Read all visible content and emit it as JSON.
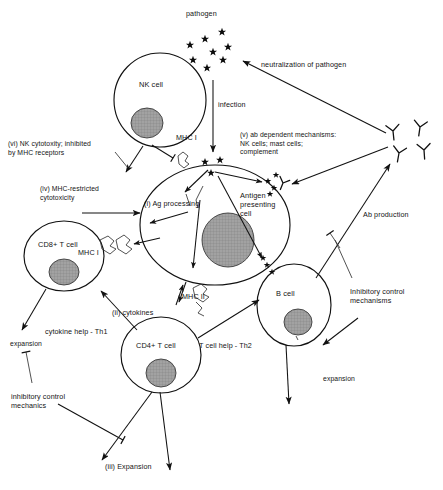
{
  "figure": {
    "background": "#ffffff",
    "ink": "#111111",
    "nucleus_fill": "#9a9a9a"
  },
  "labels": {
    "pathogen": "pathogen",
    "infection": "infection",
    "neutralization": "neutralization of pathogen",
    "nk_cell": "NK cell",
    "mhc_i_top": "MHC I",
    "mhc_i_left": "MHC I",
    "mhc_ii": "MHC II",
    "note_vi": "(vi) NK cytotoxity; inhibited\nby MHC receptors",
    "note_iv": "(iv) MHC-restricted\ncytotoxicity",
    "note_v": "(v) ab dependent mechanisms:\nNK cells; mast cells;\ncomplement",
    "step_i": "(i) Ag processing",
    "step_ii": "(ii) cytokines",
    "step_iii": "(iii) Expansion",
    "apc": "Antigen\npresenting\ncell",
    "cd8": "CD8+ T cell",
    "cd4": "CD4+ T cell",
    "b_cell": "B cell",
    "cytokine_help": "cytokine help - Th1",
    "t_cell_help": "T cell help - Th2",
    "ab_production": "Ab production",
    "expansion_left": "expansion",
    "expansion_right": "expansion",
    "inhibitory_left": "inhibitory control\nmechanics",
    "inhibitory_right": "Inhibitory control\nmechanisms"
  },
  "icons": {
    "pathogen": "star-glyph",
    "antibody": "y-shape-antibody-icon",
    "receptor": "mhc-receptor-icon",
    "inhibition": "inhibition-bar-icon",
    "arrow": "arrowhead-icon"
  },
  "cells": [
    {
      "name": "NK cell",
      "cx": 160,
      "cy": 100,
      "rx": 46,
      "ry": 47,
      "nx": 147,
      "ny": 123,
      "nrx": 16,
      "nry": 15
    },
    {
      "name": "Antigen presenting cell",
      "cx": 215,
      "cy": 225,
      "rx": 75,
      "ry": 60,
      "nx": 228,
      "ny": 240,
      "nrx": 26,
      "nry": 27
    },
    {
      "name": "CD8+ T cell",
      "cx": 64,
      "cy": 256,
      "rx": 40,
      "ry": 35,
      "nx": 64,
      "ny": 272,
      "nrx": 15,
      "nry": 13
    },
    {
      "name": "CD4+ T cell",
      "cx": 161,
      "cy": 355,
      "rx": 40,
      "ry": 38,
      "nx": 161,
      "ny": 373,
      "nrx": 15,
      "nry": 14
    },
    {
      "name": "B cell",
      "cx": 294,
      "cy": 305,
      "rx": 37,
      "ry": 41,
      "nx": 298,
      "ny": 322,
      "nrx": 14,
      "nry": 13
    }
  ],
  "pathogen_stars": [
    {
      "x": 205,
      "y": 39
    },
    {
      "x": 222,
      "y": 32
    },
    {
      "x": 190,
      "y": 45
    },
    {
      "x": 213,
      "y": 52
    },
    {
      "x": 228,
      "y": 47
    },
    {
      "x": 193,
      "y": 60
    },
    {
      "x": 223,
      "y": 60
    },
    {
      "x": 207,
      "y": 68
    }
  ],
  "apc_stars": [
    {
      "x": 205,
      "y": 162
    },
    {
      "x": 219,
      "y": 160
    },
    {
      "x": 211,
      "y": 172
    }
  ],
  "antibodies": [
    {
      "x": 393,
      "y": 131,
      "rot": -6
    },
    {
      "x": 419,
      "y": 128,
      "rot": 8
    },
    {
      "x": 398,
      "y": 152,
      "rot": 10
    },
    {
      "x": 423,
      "y": 150,
      "rot": -4
    }
  ],
  "flows": [
    {
      "from": "pathogen",
      "to": "Antigen presenting cell",
      "label": "infection"
    },
    {
      "from": "antibodies",
      "to": "pathogen",
      "label": "neutralization of pathogen"
    },
    {
      "from": "NK cell",
      "to": "Antigen presenting cell",
      "label": "(vi) NK cytotoxity; inhibited by MHC receptors",
      "kind": "inhibition"
    },
    {
      "from": "CD8+ T cell",
      "to": "Antigen presenting cell",
      "label": "(iv) MHC-restricted cytotoxicity"
    },
    {
      "from": "Antigen presenting cell",
      "to": "CD4+ T cell",
      "label": "(ii) cytokines"
    },
    {
      "from": "CD4+ T cell",
      "to": "CD8+ T cell",
      "label": "cytokine help - Th1"
    },
    {
      "from": "CD4+ T cell",
      "to": "B cell",
      "label": "T cell help - Th2"
    },
    {
      "from": "B cell",
      "to": "antibodies",
      "label": "Ab production"
    },
    {
      "from": "inhibitory control mechanics",
      "to": "expansion",
      "kind": "inhibition"
    },
    {
      "from": "inhibitory control mechanisms",
      "to": "expansion",
      "kind": "inhibition"
    },
    {
      "from": "CD4+ T cell",
      "to": "(iii) Expansion"
    }
  ]
}
